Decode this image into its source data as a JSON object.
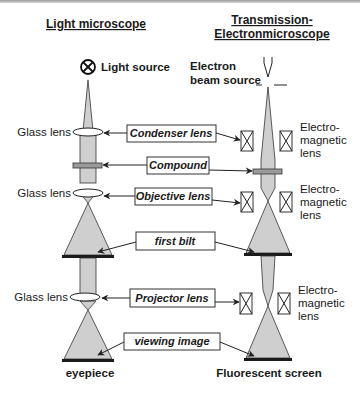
{
  "left_column": {
    "heading": "Light microscope",
    "source_label": "Light source",
    "lens_labels": [
      "Glass lens",
      "Glass lens",
      "Glass lens"
    ],
    "bottom_label": "eyepiece"
  },
  "right_column": {
    "heading_line1": "Transmission-",
    "heading_line2": "Electronmicroscope",
    "source_label_line1": "Electron",
    "source_label_line2": "beam source",
    "lens_labels": [
      {
        "line1": "Electro-",
        "line2": "magnetic",
        "line3": "lens"
      },
      {
        "line1": "Electro-",
        "line2": "magnetic",
        "line3": "lens"
      },
      {
        "line1": "Electro-",
        "line2": "magnetic",
        "line3": "lens"
      }
    ],
    "bottom_label": "Fluorescent screen"
  },
  "center_labels": {
    "condenser": "Condenser lens",
    "compound": "Compound",
    "objective": "Objective lens",
    "first_image": "first bilt",
    "projector": "Projector lens",
    "viewing": "viewing image"
  },
  "colors": {
    "beam": "#cfcfcf",
    "screen": "#1a1a1a",
    "compound": "#9a9a9a"
  }
}
